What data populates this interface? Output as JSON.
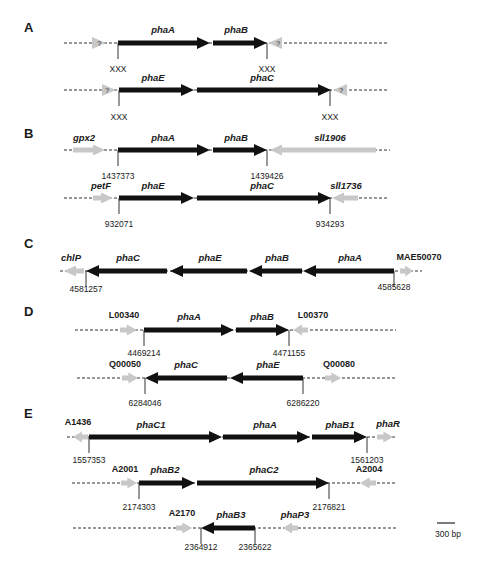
{
  "colors": {
    "gene_core": "#111111",
    "gene_flank": "#c8c8c8",
    "line": "#333333",
    "text": "#1a1a1a"
  },
  "scale_bar": {
    "label": "300 bp",
    "x1": 437,
    "x2": 455,
    "y": 523
  },
  "panels": [
    {
      "letter": "A",
      "letter_x": 24,
      "letter_y": 32,
      "rows": [
        {
          "y": 43,
          "line": [
            64,
            387
          ],
          "genes": [
            {
              "name": "?",
              "type": "flank",
              "dir": "right",
              "x1": 92,
              "x2": 106,
              "label_style": "q",
              "label_x": 99,
              "label_y": 46
            },
            {
              "name": "phaA",
              "type": "core",
              "dir": "right",
              "x1": 118,
              "x2": 210,
              "label_x": 163,
              "label_y": 33
            },
            {
              "name": "phaB",
              "type": "core",
              "dir": "right",
              "x1": 213,
              "x2": 267,
              "label_x": 236,
              "label_y": 33
            },
            {
              "name": "?",
              "type": "flank",
              "dir": "left",
              "x1": 268,
              "x2": 282,
              "label_style": "q",
              "label_x": 278,
              "label_y": 46
            }
          ],
          "ticks": [
            {
              "x": 118,
              "label": "XXX",
              "label_y": 72
            },
            {
              "x": 267,
              "label": "XXX",
              "label_y": 72
            }
          ]
        },
        {
          "y": 90,
          "line": [
            64,
            387
          ],
          "genes": [
            {
              "name": "?",
              "type": "flank",
              "dir": "right",
              "x1": 102,
              "x2": 116,
              "label_style": "q",
              "label_x": 107,
              "label_y": 93
            },
            {
              "name": "phaE",
              "type": "core",
              "dir": "right",
              "x1": 119,
              "x2": 194,
              "label_x": 153,
              "label_y": 81
            },
            {
              "name": "phaC",
              "type": "core",
              "dir": "right",
              "x1": 197,
              "x2": 331,
              "label_x": 262,
              "label_y": 81
            },
            {
              "name": "?",
              "type": "flank",
              "dir": "left",
              "x1": 333,
              "x2": 347,
              "label_style": "q",
              "label_x": 341,
              "label_y": 93
            }
          ],
          "ticks": [
            {
              "x": 119,
              "label": "XXX",
              "label_y": 120
            },
            {
              "x": 330,
              "label": "XXX",
              "label_y": 120
            }
          ]
        }
      ]
    },
    {
      "letter": "B",
      "letter_x": 24,
      "letter_y": 138,
      "rows": [
        {
          "y": 150,
          "line": [
            64,
            390
          ],
          "genes": [
            {
              "name": "gpx2",
              "type": "flank",
              "dir": "right",
              "x1": 73,
              "x2": 105,
              "label_x": 84,
              "label_y": 141
            },
            {
              "name": "phaA",
              "type": "core",
              "dir": "right",
              "x1": 118,
              "x2": 210,
              "label_x": 163,
              "label_y": 141
            },
            {
              "name": "phaB",
              "type": "core",
              "dir": "right",
              "x1": 213,
              "x2": 267,
              "label_x": 236,
              "label_y": 141
            },
            {
              "name": "sll1906",
              "type": "flank",
              "dir": "left",
              "x1": 270,
              "x2": 376,
              "label_x": 330,
              "label_y": 141
            }
          ],
          "ticks": [
            {
              "x": 118,
              "label": "1437373",
              "label_y": 179
            },
            {
              "x": 267,
              "label": "1439426",
              "label_y": 179
            }
          ]
        },
        {
          "y": 198,
          "line": [
            64,
            387
          ],
          "genes": [
            {
              "name": "petF",
              "type": "flank",
              "dir": "right",
              "x1": 93,
              "x2": 113,
              "label_x": 101,
              "label_y": 189
            },
            {
              "name": "phaE",
              "type": "core",
              "dir": "right",
              "x1": 119,
              "x2": 194,
              "label_x": 153,
              "label_y": 189
            },
            {
              "name": "phaC",
              "type": "core",
              "dir": "right",
              "x1": 197,
              "x2": 331,
              "label_x": 262,
              "label_y": 189
            },
            {
              "name": "sll1736",
              "type": "flank",
              "dir": "left",
              "x1": 332,
              "x2": 358,
              "label_x": 346,
              "label_y": 189
            }
          ],
          "ticks": [
            {
              "x": 119,
              "label": "932071",
              "label_y": 227
            },
            {
              "x": 330,
              "label": "934293",
              "label_y": 227
            }
          ]
        }
      ]
    },
    {
      "letter": "C",
      "letter_x": 24,
      "letter_y": 248,
      "rows": [
        {
          "y": 271,
          "line": [
            60,
            422
          ],
          "genes": [
            {
              "name": "chlP",
              "type": "flank",
              "dir": "left",
              "x1": 64,
              "x2": 84,
              "label_x": 71,
              "label_y": 261
            },
            {
              "name": "phaC",
              "type": "core",
              "dir": "left",
              "x1": 86,
              "x2": 167,
              "label_x": 128,
              "label_y": 261
            },
            {
              "name": "phaE",
              "type": "core",
              "dir": "left",
              "x1": 170,
              "x2": 247,
              "label_x": 210,
              "label_y": 261
            },
            {
              "name": "phaB",
              "type": "core",
              "dir": "left",
              "x1": 249,
              "x2": 302,
              "label_x": 277,
              "label_y": 261
            },
            {
              "name": "phaA",
              "type": "core",
              "dir": "left",
              "x1": 303,
              "x2": 394,
              "label_x": 350,
              "label_y": 261
            },
            {
              "name": "MAE50070",
              "type": "flank",
              "dir": "right",
              "x1": 400,
              "x2": 413,
              "label_style": "locus",
              "label_x": 419,
              "label_y": 260
            }
          ],
          "ticks": [
            {
              "x": 86,
              "label": "4581257",
              "label_y": 292
            },
            {
              "x": 394,
              "label": "4585628",
              "label_y": 290
            }
          ]
        }
      ]
    },
    {
      "letter": "D",
      "letter_x": 24,
      "letter_y": 316,
      "rows": [
        {
          "y": 330,
          "line": [
            75,
            396
          ],
          "genes": [
            {
              "name": "L00340",
              "type": "flank",
              "dir": "right",
              "x1": 120,
              "x2": 137,
              "label_style": "locus",
              "label_x": 124,
              "label_y": 318
            },
            {
              "name": "phaA",
              "type": "core",
              "dir": "right",
              "x1": 144,
              "x2": 234,
              "label_x": 189,
              "label_y": 320
            },
            {
              "name": "phaB",
              "type": "core",
              "dir": "right",
              "x1": 236,
              "x2": 289,
              "label_x": 262,
              "label_y": 320
            },
            {
              "name": "L00370",
              "type": "flank",
              "dir": "left",
              "x1": 293,
              "x2": 308,
              "label_style": "locus",
              "label_x": 313,
              "label_y": 318
            }
          ],
          "ticks": [
            {
              "x": 144,
              "label": "4469214",
              "label_y": 356
            },
            {
              "x": 289,
              "label": "4471155",
              "label_y": 356
            }
          ]
        },
        {
          "y": 378,
          "line": [
            77,
            396
          ],
          "genes": [
            {
              "name": "Q00050",
              "type": "flank",
              "dir": "right",
              "x1": 122,
              "x2": 138,
              "label_style": "locus",
              "label_x": 125,
              "label_y": 367
            },
            {
              "name": "phaC",
              "type": "core",
              "dir": "left",
              "x1": 145,
              "x2": 227,
              "label_x": 186,
              "label_y": 368
            },
            {
              "name": "phaE",
              "type": "core",
              "dir": "left",
              "x1": 230,
              "x2": 303,
              "label_x": 268,
              "label_y": 368
            },
            {
              "name": "Q00080",
              "type": "flank",
              "dir": "right",
              "x1": 325,
              "x2": 341,
              "label_style": "locus",
              "label_x": 339,
              "label_y": 367
            }
          ],
          "ticks": [
            {
              "x": 145,
              "label": "6284046",
              "label_y": 406
            },
            {
              "x": 303,
              "label": "6286220",
              "label_y": 406
            }
          ]
        }
      ]
    },
    {
      "letter": "E",
      "letter_x": 24,
      "letter_y": 418,
      "rows": [
        {
          "y": 437,
          "line": [
            67,
            397
          ],
          "genes": [
            {
              "name": "A1436",
              "type": "flank",
              "dir": "left",
              "x1": 73,
              "x2": 88,
              "label_style": "locus",
              "label_x": 78,
              "label_y": 425
            },
            {
              "name": "phaC1",
              "type": "core",
              "dir": "right",
              "x1": 89,
              "x2": 222,
              "label_x": 151,
              "label_y": 428
            },
            {
              "name": "phaA",
              "type": "core",
              "dir": "right",
              "x1": 223,
              "x2": 310,
              "label_x": 265,
              "label_y": 428
            },
            {
              "name": "phaB1",
              "type": "core",
              "dir": "right",
              "x1": 312,
              "x2": 367,
              "label_x": 340,
              "label_y": 428
            },
            {
              "name": "phaR",
              "type": "flank",
              "dir": "right",
              "x1": 377,
              "x2": 393,
              "label_x": 388,
              "label_y": 427
            }
          ],
          "ticks": [
            {
              "x": 89,
              "label": "1557353",
              "label_y": 463
            },
            {
              "x": 367,
              "label": "1561203",
              "label_y": 463
            }
          ]
        },
        {
          "y": 483,
          "line": [
            72,
            395
          ],
          "genes": [
            {
              "name": "A2001",
              "type": "flank",
              "dir": "right",
              "x1": 121,
              "x2": 137,
              "label_style": "locus",
              "label_x": 125,
              "label_y": 472
            },
            {
              "name": "phaB2",
              "type": "core",
              "dir": "right",
              "x1": 139,
              "x2": 195,
              "label_x": 165,
              "label_y": 473
            },
            {
              "name": "phaC2",
              "type": "core",
              "dir": "right",
              "x1": 197,
              "x2": 329,
              "label_x": 264,
              "label_y": 473
            },
            {
              "name": "A2004",
              "type": "flank",
              "dir": "left",
              "x1": 360,
              "x2": 376,
              "label_style": "locus",
              "label_x": 369,
              "label_y": 472
            }
          ],
          "ticks": [
            {
              "x": 139,
              "label": "2174303",
              "label_y": 510
            },
            {
              "x": 329,
              "label": "2176821",
              "label_y": 510
            }
          ]
        },
        {
          "y": 528,
          "line": [
            73,
            396
          ],
          "genes": [
            {
              "name": "A2170",
              "type": "flank",
              "dir": "right",
              "x1": 176,
              "x2": 192,
              "label_style": "locus",
              "label_x": 182,
              "label_y": 516
            },
            {
              "name": "phaB3",
              "type": "core",
              "dir": "left",
              "x1": 201,
              "x2": 255,
              "label_x": 231,
              "label_y": 518
            },
            {
              "name": "phaP3",
              "type": "flank",
              "dir": "left",
              "x1": 283,
              "x2": 298,
              "label_x": 295,
              "label_y": 518
            }
          ],
          "ticks": [
            {
              "x": 201,
              "label": "2364912",
              "label_y": 550
            },
            {
              "x": 255,
              "label": "2365622",
              "label_y": 550
            }
          ]
        }
      ]
    }
  ]
}
